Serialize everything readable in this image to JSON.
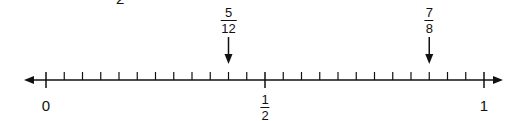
{
  "chart_data": {
    "type": "number_line",
    "range": [
      0,
      1
    ],
    "divisions": 24,
    "axis": {
      "x_start": 46,
      "x_end": 484,
      "y": 80,
      "left_arrow_x": 24,
      "right_arrow_x": 503
    },
    "major_labels": [
      {
        "value": 0,
        "text": "0"
      },
      {
        "value": 0.5,
        "numerator": "1",
        "denominator": "2"
      },
      {
        "value": 1,
        "text": "1"
      }
    ],
    "marked_points": [
      {
        "value": 0.4166667,
        "numerator": "5",
        "denominator": "12",
        "tick_index": 10
      },
      {
        "value": 0.875,
        "numerator": "7",
        "denominator": "8",
        "tick_index": 21
      }
    ]
  },
  "cut_text": "2"
}
